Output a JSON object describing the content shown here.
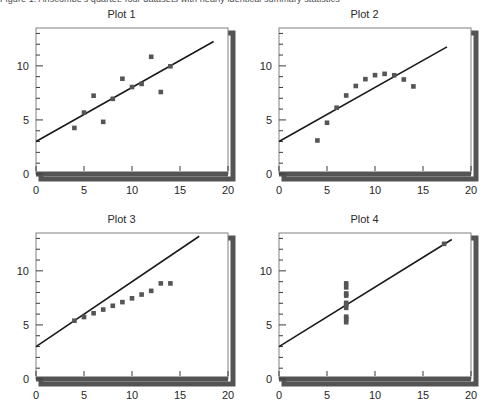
{
  "caption": {
    "text": "Figure 1.  Anscombe's quartet: four datasets with nearly identical summary statistics"
  },
  "chart_data": [
    {
      "type": "scatter",
      "title": "Plot 1",
      "xlabel": "",
      "ylabel": "",
      "xlim": [
        0,
        20
      ],
      "ylim": [
        0,
        13.5
      ],
      "xticks": [
        0,
        5,
        10,
        15,
        20
      ],
      "yticks": [
        0,
        5,
        10
      ],
      "xtick_labels": [
        "0",
        "5",
        "10",
        "15",
        "20"
      ],
      "ytick_labels": [
        "0",
        "5",
        "10"
      ],
      "minor_tick_step": 1,
      "grid": false,
      "legend": null,
      "marker": "square",
      "marker_color": "#555555",
      "line_color": "#1a1a1a",
      "x": [
        10.0,
        8.0,
        13.0,
        9.0,
        11.0,
        14.0,
        6.0,
        4.0,
        12.0,
        7.0,
        5.0
      ],
      "y": [
        8.04,
        6.95,
        7.58,
        8.81,
        8.33,
        9.96,
        7.24,
        4.26,
        10.84,
        4.82,
        5.68
      ],
      "fit_line": {
        "intercept": 3.0,
        "slope": 0.5,
        "x_start": 0.0,
        "x_end": 18.5
      }
    },
    {
      "type": "scatter",
      "title": "Plot 2",
      "xlabel": "",
      "ylabel": "",
      "xlim": [
        0,
        20
      ],
      "ylim": [
        0,
        13.5
      ],
      "xticks": [
        0,
        5,
        10,
        15,
        20
      ],
      "yticks": [
        0,
        5,
        10
      ],
      "xtick_labels": [
        "0",
        "5",
        "10",
        "15",
        "20"
      ],
      "ytick_labels": [
        "0",
        "5",
        "10"
      ],
      "minor_tick_step": 1,
      "grid": false,
      "legend": null,
      "marker": "square",
      "marker_color": "#555555",
      "line_color": "#1a1a1a",
      "x": [
        10.0,
        8.0,
        13.0,
        9.0,
        11.0,
        14.0,
        6.0,
        4.0,
        12.0,
        7.0,
        5.0
      ],
      "y": [
        9.14,
        8.14,
        8.74,
        8.77,
        9.26,
        8.1,
        6.13,
        3.1,
        9.13,
        7.26,
        4.74
      ],
      "fit_line": {
        "intercept": 3.0,
        "slope": 0.5,
        "x_start": 0.0,
        "x_end": 17.5
      }
    },
    {
      "type": "scatter",
      "title": "Plot 3",
      "xlabel": "",
      "ylabel": "",
      "xlim": [
        0,
        20
      ],
      "ylim": [
        0,
        13.5
      ],
      "xticks": [
        0,
        5,
        10,
        15,
        20
      ],
      "yticks": [
        0,
        5,
        10
      ],
      "xtick_labels": [
        "0",
        "5",
        "10",
        "15",
        "20"
      ],
      "ytick_labels": [
        "0",
        "5",
        "10"
      ],
      "minor_tick_step": 1,
      "grid": false,
      "legend": null,
      "marker": "square",
      "marker_color": "#555555",
      "line_color": "#1a1a1a",
      "x": [
        10.0,
        8.0,
        13.0,
        9.0,
        11.0,
        14.0,
        6.0,
        4.0,
        12.0,
        7.0,
        5.0
      ],
      "y": [
        7.46,
        6.77,
        8.84,
        7.11,
        7.81,
        8.84,
        6.08,
        5.39,
        8.15,
        6.42,
        5.73
      ],
      "fit_line": {
        "intercept": 3.0,
        "slope": 0.6,
        "x_start": 0.0,
        "x_end": 17.0
      }
    },
    {
      "type": "scatter",
      "title": "Plot 4",
      "xlabel": "",
      "ylabel": "",
      "xlim": [
        0,
        20
      ],
      "ylim": [
        0,
        13.5
      ],
      "xticks": [
        0,
        5,
        10,
        15,
        20
      ],
      "yticks": [
        0,
        5,
        10
      ],
      "xtick_labels": [
        "0",
        "5",
        "10",
        "15",
        "20"
      ],
      "ytick_labels": [
        "0",
        "5",
        "10"
      ],
      "minor_tick_step": 1,
      "grid": false,
      "legend": null,
      "marker": "square",
      "marker_color": "#555555",
      "line_color": "#1a1a1a",
      "x": [
        7.0,
        7.0,
        7.0,
        7.0,
        7.0,
        7.0,
        7.0,
        17.2,
        7.0,
        7.0,
        7.0
      ],
      "y": [
        6.58,
        5.76,
        7.71,
        8.84,
        8.47,
        7.04,
        5.25,
        12.5,
        5.56,
        7.91,
        6.89
      ],
      "fit_line": {
        "intercept": 3.0,
        "slope": 0.55,
        "x_start": 0.0,
        "x_end": 18.0
      }
    }
  ],
  "style": {
    "axis_color": "#3a3a3a",
    "frame_color": "#808080",
    "shadow_color": "#545454",
    "background": "#ffffff"
  }
}
